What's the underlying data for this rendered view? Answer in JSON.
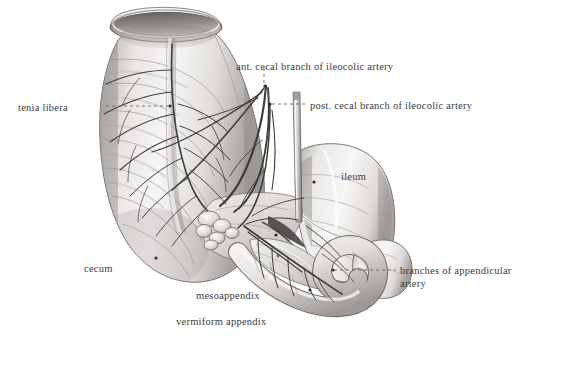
{
  "figure": {
    "domain": "anatomical-illustration",
    "background_color": "#ffffff",
    "ink_color": "#3a3a3c",
    "line_color": "#4a4a4d",
    "tone_light": "#f2f1f0",
    "tone_mid": "#d8d6d4",
    "tone_dark": "#9b9896",
    "tone_shadow": "#6e6b69"
  },
  "labels": [
    {
      "id": "ant-cecal-branch",
      "text": "ant. cecal branch of ileocolic artery",
      "x": 236,
      "y": 60,
      "align": "left",
      "leader": "vertical-dashed-down"
    },
    {
      "id": "post-cecal-branch",
      "text": "post. cecal branch of ileocolic artery",
      "x": 310,
      "y": 99,
      "align": "left",
      "leader": "horizontal-dashed-left"
    },
    {
      "id": "tenia-libera",
      "text": "tenia libera",
      "x": 18,
      "y": 101,
      "align": "left",
      "leader": "horizontal-dashed-right"
    },
    {
      "id": "ileum",
      "text": "ileum",
      "x": 341,
      "y": 170,
      "align": "left",
      "leader": "none"
    },
    {
      "id": "branches-appendicular-artery",
      "text": "branches of appendicular artery",
      "x": 400,
      "y": 264,
      "align": "left",
      "leader": "horizontal-dashed-left"
    },
    {
      "id": "cecum",
      "text": "cecum",
      "x": 84,
      "y": 262,
      "align": "left",
      "leader": "none"
    },
    {
      "id": "mesoappendix",
      "text": "mesoappendix",
      "x": 196,
      "y": 289,
      "align": "left",
      "leader": "dotted-up-right"
    },
    {
      "id": "vermiform-appendix",
      "text": "vermiform appendix",
      "x": 176,
      "y": 315,
      "align": "left",
      "leader": "none"
    }
  ],
  "leaders": [
    {
      "id": "leader-tenia-libera",
      "points": "106,106 170,106",
      "style": "dashed",
      "dot": "170,106"
    },
    {
      "id": "leader-ant-cecal",
      "points": "263,70 263,86",
      "style": "dashed",
      "dot": "266,86"
    },
    {
      "id": "leader-post-cecal",
      "points": "270,104 305,104",
      "style": "dashed",
      "dot": "270,104"
    },
    {
      "id": "leader-appendicular",
      "points": "333,270 396,270",
      "style": "dashed",
      "dot": "333,270"
    },
    {
      "id": "leader-mesoappendix",
      "points": "262,284 277,257",
      "style": "dotted",
      "dot": "277,257"
    }
  ],
  "structures": [
    {
      "id": "ascending-colon",
      "name": "ascending colon / cecum body"
    },
    {
      "id": "colon-cut-lumen",
      "name": "cut end of colon showing lumen"
    },
    {
      "id": "tenia-libera-band",
      "name": "tenia libera muscular band"
    },
    {
      "id": "ileum-loop",
      "name": "terminal ileum"
    },
    {
      "id": "ileocecal-junction",
      "name": "ileocecal junction"
    },
    {
      "id": "mesoappendix-fold",
      "name": "mesoappendix peritoneal fold"
    },
    {
      "id": "vermiform-appendix-body",
      "name": "vermiform appendix, coiled"
    },
    {
      "id": "ileocolic-artery-trunk",
      "name": "ileocolic artery trunk"
    },
    {
      "id": "ant-cecal-artery",
      "name": "anterior cecal artery"
    },
    {
      "id": "post-cecal-artery",
      "name": "posterior cecal artery"
    },
    {
      "id": "appendicular-artery",
      "name": "appendicular artery and branches"
    },
    {
      "id": "dissection-probe",
      "name": "dissection probe / retractor blade"
    },
    {
      "id": "cecal-vessel-arcade",
      "name": "cecal vascular arcade"
    },
    {
      "id": "lymph-node-cluster",
      "name": "ileocolic lymph nodes"
    }
  ]
}
